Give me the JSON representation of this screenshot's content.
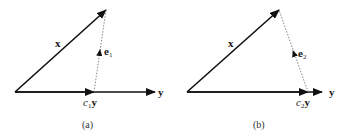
{
  "panels": [
    {
      "id": "a",
      "caption": "(a)",
      "labels": {
        "x": "x",
        "y": "y",
        "e": "e",
        "e_sub": "1",
        "c": "c",
        "c_sub": "1",
        "cy": "y"
      }
    },
    {
      "id": "b",
      "caption": "(b)",
      "labels": {
        "x": "x",
        "y": "y",
        "e": "e",
        "e_sub": "2",
        "c": "c",
        "c_sub": "2",
        "cy": "y"
      }
    }
  ]
}
